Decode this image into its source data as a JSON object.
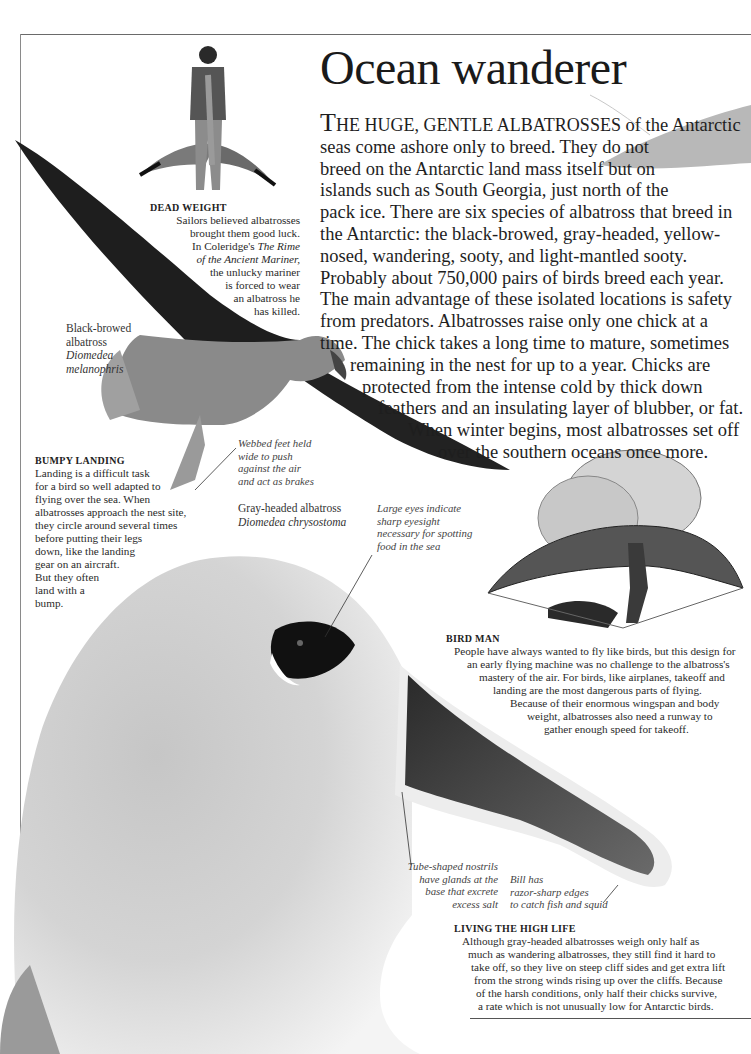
{
  "page": {
    "title": "Ocean wanderer"
  },
  "intro": {
    "dropcap": "T",
    "smallcaps": "HE HUGE, GENTLE ALBATROSSES",
    "lines": [
      " of the Antarctic",
      "seas come ashore only to breed. They do not",
      "breed on the Antarctic land mass itself but on",
      "islands such as South Georgia, just north of the",
      "pack ice. There are six species of albatross that breed in",
      "the Antarctic: the black-browed, gray-headed, yellow-",
      "nosed, wandering, sooty, and light-mantled sooty.",
      "Probably about 750,000 pairs of birds breed each year.",
      "The main advantage of these isolated locations is safety",
      "from predators. Albatrosses raise only one chick at a",
      "time. The chick takes a long time to mature, sometimes",
      "remaining in the nest for up to a year. Chicks are",
      "protected from the intense cold by thick down",
      "feathers and an insulating layer of blubber, or fat.",
      "When winter begins, most albatrosses set off",
      "over the southern oceans once more."
    ]
  },
  "captions": {
    "dead_weight": {
      "heading": "DEAD WEIGHT",
      "lines": [
        "Sailors believed albatrosses",
        "brought them good luck.",
        "In Coleridge's ",
        "of the Ancient Mariner,",
        "the unlucky mariner",
        "is forced to wear",
        "an albatross he",
        "has killed."
      ],
      "italic_title_part1": "The Rime"
    },
    "bumpy_landing": {
      "heading": "BUMPY LANDING",
      "lines": [
        "Landing is a difficult task",
        "for a bird so well adapted to",
        "flying over the sea. When",
        "albatrosses approach the nest site,",
        "they circle around several times",
        "before putting their legs",
        "down, like the landing",
        "gear on an aircraft.",
        "But they often",
        "land with a",
        "bump."
      ]
    },
    "bird_man": {
      "heading": "BIRD MAN",
      "lines": [
        "People have always wanted to fly like birds, but this design for",
        "an early flying machine was no challenge to the albatross's",
        "mastery of the air. For birds, like airplanes, takeoff and",
        "landing are the most dangerous parts of flying.",
        "Because of their enormous wingspan and body",
        "weight, albatrosses also need a runway to",
        "gather enough speed for takeoff."
      ]
    },
    "high_life": {
      "heading": "LIVING THE HIGH LIFE",
      "lines": [
        "Although gray-headed albatrosses weigh only half as",
        "much as wandering albatrosses, they still find it hard to",
        "take off, so they live on steep cliff sides and get extra lift",
        "from the strong winds rising up over the cliffs. Because",
        "of the harsh conditions, only half their chicks survive,",
        "a rate which is not unusually low for Antarctic birds."
      ]
    }
  },
  "labels": {
    "black_browed": {
      "common": [
        "Black-browed",
        "albatross"
      ],
      "latin": [
        "Diomedea",
        "melanophris"
      ]
    },
    "gray_headed": {
      "common": "Gray-headed albatross",
      "latin": "Diomedea chrysostoma"
    }
  },
  "notes": {
    "webbed_feet": [
      "Webbed feet held",
      "wide to push",
      "against the air",
      "and act as brakes"
    ],
    "large_eyes": [
      "Large eyes indicate",
      "sharp eyesight",
      "necessary for spotting",
      "food in the sea"
    ],
    "nostrils": [
      "Tube-shaped nostrils",
      "have glands at the",
      "base that excrete",
      "excess salt"
    ],
    "bill": [
      "Bill has",
      "razor-sharp edges",
      "to catch fish and squid"
    ]
  }
}
